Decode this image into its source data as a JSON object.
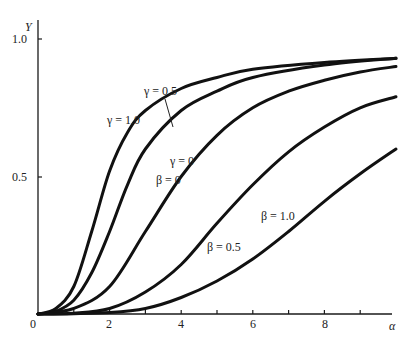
{
  "chart_data": {
    "type": "line",
    "title": "",
    "xlabel": "α",
    "ylabel": "Y",
    "xlim": [
      0,
      10
    ],
    "ylim": [
      0,
      1.0
    ],
    "grid": false,
    "x_ticks": [
      0,
      1,
      2,
      3,
      4,
      5,
      6,
      7,
      8,
      9
    ],
    "x_tick_labels": [
      {
        "value": 0,
        "label": "0"
      },
      {
        "value": 2,
        "label": "2"
      },
      {
        "value": 4,
        "label": "4"
      },
      {
        "value": 6,
        "label": "6"
      },
      {
        "value": 8,
        "label": "8"
      }
    ],
    "y_tick_labels": [
      {
        "value": 0.5,
        "label": "0.5"
      },
      {
        "value": 1.0,
        "label": "1.0"
      }
    ],
    "series": [
      {
        "name": "γ = 1.0",
        "x": [
          0,
          0.5,
          1,
          1.5,
          2,
          2.5,
          3,
          4,
          5,
          6,
          8,
          10
        ],
        "values": [
          0,
          0.02,
          0.1,
          0.3,
          0.52,
          0.66,
          0.74,
          0.82,
          0.86,
          0.89,
          0.915,
          0.93
        ]
      },
      {
        "name": "γ = 0.5",
        "x": [
          0,
          0.5,
          1,
          1.5,
          2,
          2.5,
          3,
          4,
          5,
          6,
          8,
          10
        ],
        "values": [
          0,
          0.01,
          0.05,
          0.15,
          0.3,
          0.47,
          0.6,
          0.74,
          0.81,
          0.86,
          0.905,
          0.93
        ]
      },
      {
        "name": "γ = 0, β = 0",
        "x": [
          0,
          1,
          2,
          3,
          4,
          5,
          6,
          7,
          8,
          9,
          10
        ],
        "values": [
          0,
          0.02,
          0.1,
          0.3,
          0.5,
          0.65,
          0.75,
          0.81,
          0.85,
          0.88,
          0.9
        ]
      },
      {
        "name": "β = 0.5",
        "x": [
          0,
          1,
          2,
          3,
          4,
          5,
          6,
          7,
          8,
          9,
          10
        ],
        "values": [
          0,
          0.003,
          0.02,
          0.08,
          0.18,
          0.33,
          0.47,
          0.59,
          0.68,
          0.75,
          0.79
        ]
      },
      {
        "name": "β = 1.0",
        "x": [
          0,
          1,
          2,
          3,
          4,
          5,
          6,
          7,
          8,
          9,
          10
        ],
        "values": [
          0,
          0.001,
          0.005,
          0.02,
          0.06,
          0.12,
          0.2,
          0.3,
          0.41,
          0.51,
          0.6
        ]
      }
    ],
    "annotations": [
      {
        "text": "γ = 0.5",
        "series": 1
      },
      {
        "text": "γ = 1.0",
        "series": 0
      },
      {
        "text": "γ = 0",
        "series": 2
      },
      {
        "text": "β = 0",
        "series": 2
      },
      {
        "text": "β = 0.5",
        "series": 3
      },
      {
        "text": "β = 1.0",
        "series": 4
      }
    ]
  },
  "labels": {
    "origin": "0",
    "x_axis": "α",
    "y_axis": "Y",
    "y_1_0": "1.0",
    "y_0_5": "0.5",
    "x_2": "2",
    "x_4": "4",
    "x_6": "6",
    "x_8": "8",
    "gamma_05": "γ = 0.5",
    "gamma_10": "γ = 1.0",
    "gamma_0": "γ = 0",
    "beta_0": "β = 0",
    "beta_05": "β = 0.5",
    "beta_10": "β = 1.0"
  }
}
